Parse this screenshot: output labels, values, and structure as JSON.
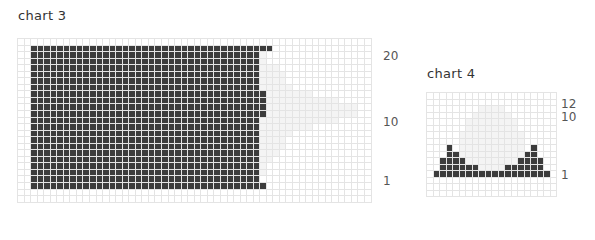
{
  "chart3": {
    "title": "chart 3",
    "cols": 54,
    "rows": 25,
    "cell": 6.55,
    "origin": [
      17,
      38
    ],
    "row_labels": [
      {
        "text": "20",
        "row": 2
      },
      {
        "text": "10",
        "row": 12
      },
      {
        "text": "1",
        "row": 21
      }
    ],
    "colors": {
      "dark": "#3c3c3c",
      "light": "#f4f4f4",
      "grid": "#e4e4e4"
    },
    "dark_rects": [
      {
        "r0": 1,
        "r1": 22,
        "c0": 2,
        "c1": 36
      },
      {
        "r0": 1,
        "r1": 1,
        "c0": 37,
        "c1": 38
      }
    ],
    "light_shape": [
      {
        "row": 2,
        "c0": 37,
        "c1": 37
      },
      {
        "row": 3,
        "c0": 37,
        "c1": 37
      },
      {
        "row": 4,
        "c0": 37,
        "c1": 39
      },
      {
        "row": 5,
        "c0": 37,
        "c1": 40
      },
      {
        "row": 6,
        "c0": 37,
        "c1": 40
      },
      {
        "row": 7,
        "c0": 37,
        "c1": 41
      },
      {
        "row": 8,
        "c0": 37,
        "c1": 44
      },
      {
        "row": 9,
        "c0": 37,
        "c1": 48
      },
      {
        "row": 10,
        "c0": 37,
        "c1": 51
      },
      {
        "row": 11,
        "c0": 37,
        "c1": 51
      },
      {
        "row": 12,
        "c0": 37,
        "c1": 48
      },
      {
        "row": 13,
        "c0": 37,
        "c1": 44
      },
      {
        "row": 14,
        "c0": 37,
        "c1": 41
      },
      {
        "row": 15,
        "c0": 37,
        "c1": 40
      },
      {
        "row": 16,
        "c0": 37,
        "c1": 40
      },
      {
        "row": 17,
        "c0": 37,
        "c1": 39
      },
      {
        "row": 18,
        "c0": 37,
        "c1": 38
      },
      {
        "row": 19,
        "c0": 37,
        "c1": 37
      },
      {
        "row": 20,
        "c0": 37,
        "c1": 37
      }
    ],
    "dark_extra": [
      {
        "row": 8,
        "c0": 37,
        "c1": 37
      },
      {
        "row": 9,
        "c0": 37,
        "c1": 37
      },
      {
        "row": 10,
        "c0": 37,
        "c1": 37
      },
      {
        "row": 11,
        "c0": 37,
        "c1": 37
      },
      {
        "row": 22,
        "c0": 37,
        "c1": 37
      }
    ]
  },
  "chart4": {
    "title": "chart 4",
    "cols": 20,
    "rows": 16,
    "cell": 6.5,
    "origin": [
      426,
      92
    ],
    "row_labels": [
      {
        "text": "12",
        "row": 1
      },
      {
        "text": "10",
        "row": 3
      },
      {
        "text": "1",
        "row": 12
      }
    ],
    "light_shape": [
      {
        "row": 2,
        "c0": 8,
        "c1": 11
      },
      {
        "row": 3,
        "c0": 7,
        "c1": 12
      },
      {
        "row": 4,
        "c0": 6,
        "c1": 13
      },
      {
        "row": 5,
        "c0": 6,
        "c1": 13
      },
      {
        "row": 6,
        "c0": 5,
        "c1": 14
      },
      {
        "row": 7,
        "c0": 5,
        "c1": 14
      },
      {
        "row": 8,
        "c0": 5,
        "c1": 14
      },
      {
        "row": 9,
        "c0": 5,
        "c1": 14
      },
      {
        "row": 10,
        "c0": 6,
        "c1": 13
      },
      {
        "row": 11,
        "c0": 7,
        "c1": 12
      }
    ],
    "dark_rows": [
      {
        "row": 8,
        "cells": [
          3,
          16
        ]
      },
      {
        "row": 9,
        "cells": [
          3,
          4,
          15,
          16
        ]
      },
      {
        "row": 10,
        "cells": [
          2,
          3,
          4,
          5,
          14,
          15,
          16,
          17
        ]
      },
      {
        "row": 11,
        "cells": [
          2,
          3,
          4,
          5,
          6,
          7,
          12,
          13,
          14,
          15,
          16,
          17
        ]
      },
      {
        "row": 12,
        "cells": [
          1,
          2,
          3,
          4,
          5,
          6,
          7,
          8,
          9,
          10,
          11,
          12,
          13,
          14,
          15,
          16,
          17,
          18
        ]
      }
    ]
  }
}
